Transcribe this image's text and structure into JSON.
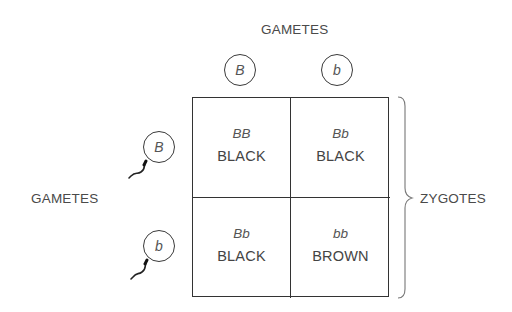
{
  "diagram": {
    "type": "punnett-square",
    "top_axis_label": "GAMETES",
    "left_axis_label": "GAMETES",
    "right_label": "ZYGOTES",
    "top_gametes": [
      {
        "allele": "B"
      },
      {
        "allele": "b"
      }
    ],
    "left_gametes": [
      {
        "allele": "B",
        "shape": "sperm"
      },
      {
        "allele": "b",
        "shape": "sperm"
      }
    ],
    "cells": [
      [
        {
          "genotype": "BB",
          "phenotype": "BLACK"
        },
        {
          "genotype": "Bb",
          "phenotype": "BLACK"
        }
      ],
      [
        {
          "genotype": "Bb",
          "phenotype": "BLACK"
        },
        {
          "genotype": "bb",
          "phenotype": "BROWN"
        }
      ]
    ],
    "colors": {
      "line": "#333333",
      "text": "#4a4a4a",
      "background": "#ffffff"
    }
  }
}
